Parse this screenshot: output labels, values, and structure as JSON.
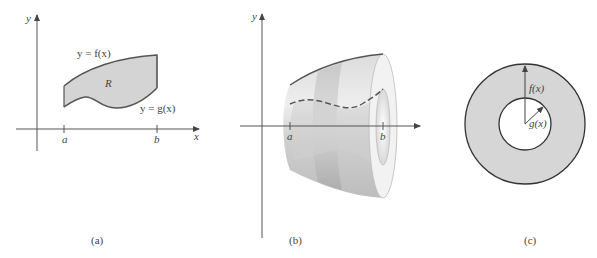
{
  "figure": {
    "panels": [
      {
        "id": "a",
        "caption": "(a)",
        "axis_x_label": "x",
        "axis_y_label": "y",
        "tick_a": "a",
        "tick_b": "b",
        "upper_curve_label": "y = f(x)",
        "lower_curve_label": "y = g(x)",
        "region_label": "R"
      },
      {
        "id": "b",
        "caption": "(b)",
        "axis_x_label": "x",
        "axis_y_label": "y",
        "tick_a": "a",
        "tick_b": "b"
      },
      {
        "id": "c",
        "caption": "(c)",
        "outer_radius_label": "f(x)",
        "inner_radius_label": "g(x)"
      }
    ],
    "colors": {
      "region_fill": "#d4d4d4",
      "outline": "#555555",
      "axis": "#555555",
      "solid_light": "#e6e6e6",
      "solid_dark": "#a8a8a8",
      "washer_fill": "#d6d6d6"
    }
  }
}
